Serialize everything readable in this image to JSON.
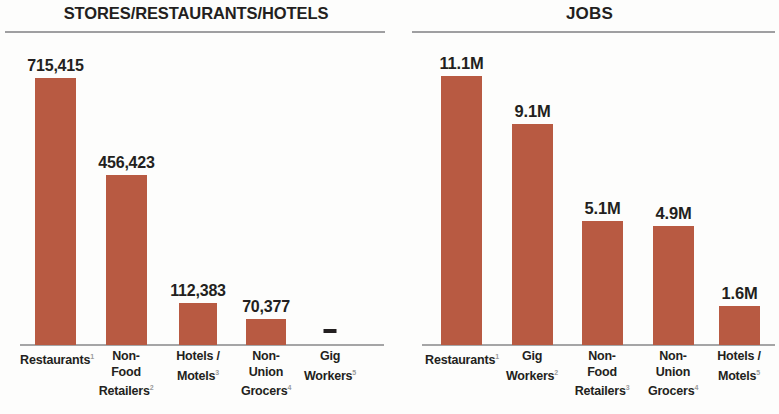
{
  "chart_data": [
    {
      "type": "bar",
      "title": "STORES/RESTAURANTS/HOTELS",
      "xlabel": "",
      "ylabel": "",
      "grid": false,
      "legend": "none",
      "ylim": [
        0,
        800000
      ],
      "categories": [
        "Restaurants",
        "Non-Food Retailers",
        "Hotels / Motels",
        "Non-Union Grocers",
        "Gig Workers"
      ],
      "category_lines": [
        [
          "Restaurants"
        ],
        [
          "Non-",
          "Food",
          "Retailers"
        ],
        [
          "Hotels /",
          "Motels"
        ],
        [
          "Non-",
          "Union",
          "Grocers"
        ],
        [
          "Gig",
          "Workers"
        ]
      ],
      "footnotes": [
        "1",
        "2",
        "3",
        "4",
        "5"
      ],
      "values": [
        715415,
        456423,
        112383,
        70377,
        null
      ],
      "value_labels": [
        "715,415",
        "456,423",
        "112,383",
        "70,377",
        "–"
      ],
      "bar_color": "#b85a42"
    },
    {
      "type": "bar",
      "title": "JOBS",
      "xlabel": "",
      "ylabel": "",
      "grid": false,
      "legend": "none",
      "ylim": [
        0,
        12.4
      ],
      "categories": [
        "Restaurants",
        "Gig Workers",
        "Non-Food Retailers",
        "Non-Union Grocers",
        "Hotels / Motels"
      ],
      "category_lines": [
        [
          "Restaurants"
        ],
        [
          "Gig",
          "Workers"
        ],
        [
          "Non-",
          "Food",
          "Retailers"
        ],
        [
          "Non-",
          "Union",
          "Grocers"
        ],
        [
          "Hotels /",
          "Motels"
        ]
      ],
      "footnotes": [
        "1",
        "2",
        "3",
        "4",
        "5"
      ],
      "values": [
        11.1,
        9.1,
        5.1,
        4.9,
        1.6
      ],
      "value_labels": [
        "11.1M",
        "9.1M",
        "5.1M",
        "4.9M",
        "1.6M"
      ],
      "bar_color": "#b85a42"
    }
  ],
  "left_panel": {
    "title": "STORES/RESTAURANTS/HOTELS"
  },
  "right_panel": {
    "title": "JOBS"
  }
}
